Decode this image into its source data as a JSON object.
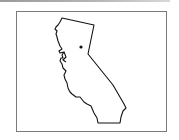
{
  "map": {
    "region": "California",
    "marker": {
      "label": "",
      "x": 81,
      "y": 47
    },
    "colors": {
      "outline": "#111111",
      "frame": "#7a7a7a",
      "background": "#ffffff",
      "marker": "#111111"
    }
  }
}
